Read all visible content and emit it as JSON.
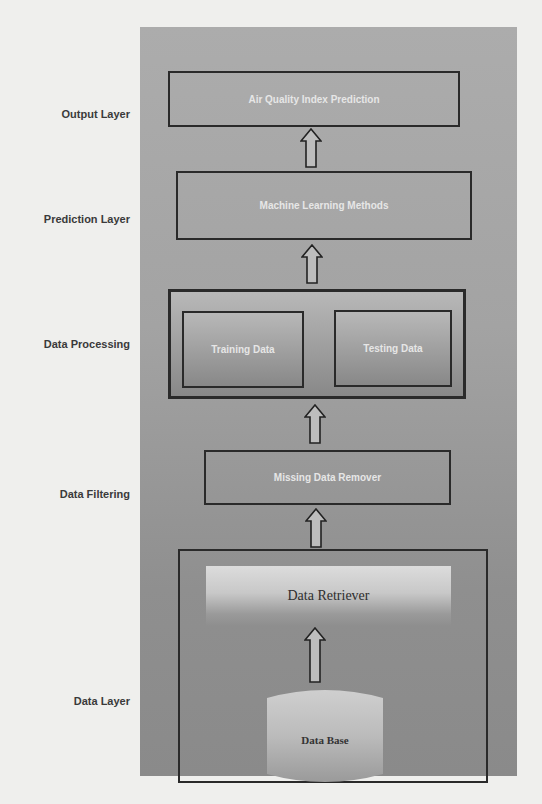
{
  "diagram": {
    "layers": [
      {
        "label": "Output Layer"
      },
      {
        "label": "Prediction Layer"
      },
      {
        "label": "Data Processing"
      },
      {
        "label": "Data Filtering"
      },
      {
        "label": "Data Layer"
      }
    ],
    "nodes": {
      "output": "Air Quality Index Prediction",
      "prediction": "Machine Learning Methods",
      "training": "Training Data",
      "testing": "Testing Data",
      "filter": "Missing Data Remover",
      "retriever": "Data Retriever",
      "database": "Data Base"
    },
    "edges": [
      {
        "from": "Data Base",
        "to": "Data Retriever"
      },
      {
        "from": "Data Layer",
        "to": "Missing Data Remover"
      },
      {
        "from": "Missing Data Remover",
        "to": "Data Processing"
      },
      {
        "from": "Data Processing",
        "to": "Machine Learning Methods"
      },
      {
        "from": "Machine Learning Methods",
        "to": "Air Quality Index Prediction"
      }
    ],
    "colors": {
      "panel": "#a3a3a3",
      "border": "#2a2a2a",
      "box_text": "#e6e6e6",
      "label_text": "#3a3a3a"
    }
  }
}
